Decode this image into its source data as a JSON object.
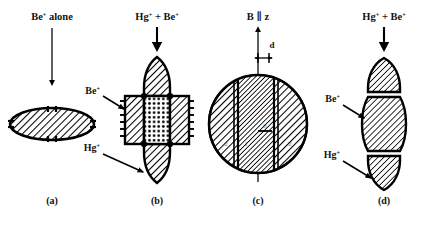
{
  "figure": {
    "title_alt": "Ion cloud shapes for Be+ alone and Hg+ + Be+ mixtures in a Penning trap",
    "background_color": "#ffffff",
    "ink_color": "#000000"
  },
  "panels": [
    {
      "id": "a",
      "caption": "(a)",
      "top_label": "Be",
      "top_label_sup": "+",
      "top_label_tail": " alone",
      "arrow": {
        "direction": "down",
        "length_px": 78,
        "style": "thin-long"
      },
      "shape": "ellipse-horizontal",
      "fill": "diagonal-hatch",
      "edge_ticks": true
    },
    {
      "id": "b",
      "caption": "(b)",
      "top_label": "Hg",
      "top_label_sup": "+",
      "top_label_mid": " + Be",
      "top_label_sup2": "+",
      "arrow": {
        "direction": "down",
        "length_px": 24,
        "style": "thick-short"
      },
      "callouts": [
        {
          "text": "Be",
          "sup": "+",
          "target": "side-column",
          "arrow": "down-right"
        },
        {
          "text": "Hg",
          "sup": "+",
          "target": "bottom-lobe",
          "arrow": "down-right"
        }
      ],
      "shape": "stacked-lobes-with-core",
      "core_fill": "dotted-stipple",
      "side_fill": "diagonal-hatch",
      "lobe_fill": "diagonal-hatch",
      "edge_ticks": true
    },
    {
      "id": "c",
      "caption": "(c)",
      "top_label": "B",
      "top_label_mid": " ∥ ",
      "top_label_tail": "z",
      "arrow": {
        "direction": "up",
        "length_px": 46,
        "style": "thin-long"
      },
      "dimension": {
        "label": "d",
        "style": "double-headed-arrow"
      },
      "shape": "circle-cross-section",
      "inner_labels": [
        "2",
        "1",
        "b",
        "2"
      ],
      "center_band_fill": "dense-diagonal-hatch",
      "outer_fill": "diagonal-hatch"
    },
    {
      "id": "d",
      "caption": "(d)",
      "top_label": "Hg",
      "top_label_sup": "+",
      "top_label_mid": " + Be",
      "top_label_sup2": "+",
      "arrow": {
        "direction": "down",
        "length_px": 24,
        "style": "thick-short"
      },
      "callouts": [
        {
          "text": "Be",
          "sup": "+",
          "target": "middle-block",
          "arrow": "down-right"
        },
        {
          "text": "Hg",
          "sup": "+",
          "target": "bottom-cap",
          "arrow": "down-right"
        }
      ],
      "shape": "stacked-three-blocks",
      "fill": "diagonal-hatch",
      "separator": "white-gap"
    }
  ]
}
